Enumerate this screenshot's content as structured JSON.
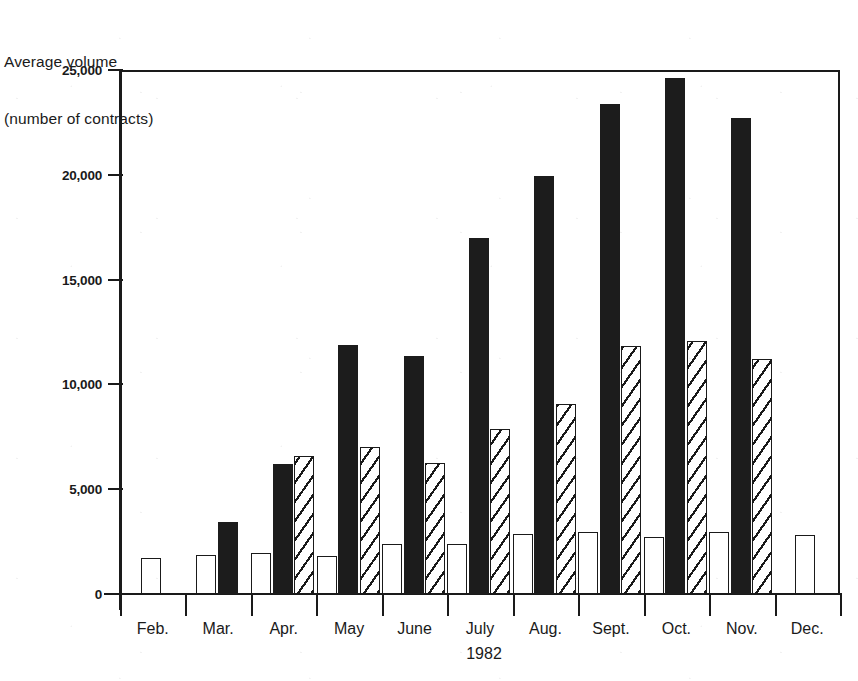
{
  "title": {
    "line1": "Average volume",
    "line2": "(number of contracts)"
  },
  "axes": {
    "y_ticks": [
      "0",
      "5,000",
      "10,000",
      "15,000",
      "20,000",
      "25,000"
    ],
    "x_labels": [
      "Feb.",
      "Mar.",
      "Apr.",
      "May",
      "June",
      "July",
      "Aug.",
      "Sept.",
      "Oct.",
      "Nov.",
      "Dec."
    ],
    "year": "1982"
  },
  "colors": {
    "ink": "#1a1a1a",
    "solid_fill": "#1c1c1c",
    "open_fill": "#ffffff",
    "paper": "#ffffff"
  },
  "chart_data": {
    "type": "bar",
    "title": "Average volume (number of contracts)",
    "xlabel": "1982",
    "ylabel": "Average volume (number of contracts)",
    "ylim": [
      0,
      25000
    ],
    "ytick_values": [
      0,
      5000,
      10000,
      15000,
      20000,
      25000
    ],
    "grid": false,
    "legend": "none",
    "categories": [
      "Feb.",
      "Mar.",
      "Apr.",
      "May",
      "June",
      "July",
      "Aug.",
      "Sept.",
      "Oct.",
      "Nov.",
      "Dec."
    ],
    "series": [
      {
        "name": "open",
        "style": "white/outlined",
        "values": [
          1700,
          1850,
          1950,
          1800,
          2400,
          2400,
          2850,
          2950,
          2700,
          2950,
          2800
        ]
      },
      {
        "name": "solid",
        "style": "black/filled",
        "values": [
          null,
          3450,
          6200,
          11900,
          11350,
          17000,
          19950,
          23400,
          24600,
          22700,
          null
        ]
      },
      {
        "name": "hatched",
        "style": "diagonal-hatch",
        "values": [
          null,
          null,
          6600,
          7000,
          6250,
          7850,
          9050,
          11850,
          12050,
          11200,
          null
        ]
      }
    ]
  }
}
